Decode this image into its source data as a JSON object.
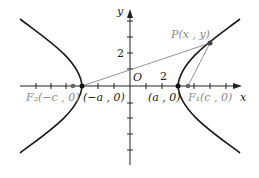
{
  "diagram": {
    "type": "hyperbola",
    "axes": {
      "x_label": "x",
      "y_label": "y",
      "origin_label": "O",
      "x_tick_label": "2",
      "y_tick_label": "2"
    },
    "points": {
      "P": {
        "label": "P(x , y)"
      },
      "vertex_left": {
        "label": "(−a , 0)"
      },
      "vertex_right": {
        "label": "(a , 0)"
      },
      "focus_left": {
        "label": "F₂(−c , 0)"
      },
      "focus_right": {
        "label": "F₁(c , 0)"
      }
    },
    "colors": {
      "curve": "#1a1a1a",
      "axis": "#222222",
      "focal_lines": "#777777",
      "focus_labels": "#8a8a8a",
      "vertex_labels": "#222222"
    }
  }
}
